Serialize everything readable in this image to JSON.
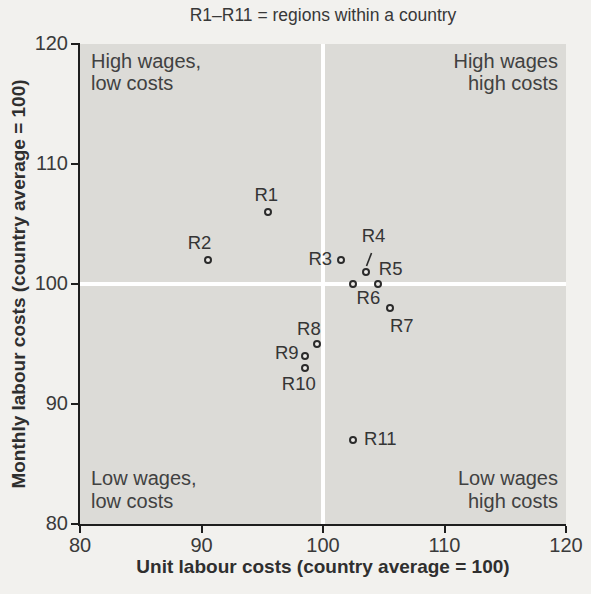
{
  "colors": {
    "page_bg": "#f2f1ee",
    "plot_bg": "#dcdbd7",
    "gridline": "#ffffff",
    "axis": "#1e1e1e",
    "text": "#3a3a3a",
    "marker_ring": "#2b2b2b",
    "marker_fill": "#eceae7"
  },
  "chart_data": {
    "type": "scatter",
    "title": "R1–R11 = regions within a country",
    "xlabel": "Unit labour costs (country average = 100)",
    "ylabel": "Monthly labour costs (country average = 100)",
    "xlim": [
      80,
      120
    ],
    "ylim": [
      80,
      120
    ],
    "xticks": [
      80,
      90,
      100,
      110,
      120
    ],
    "yticks": [
      80,
      90,
      100,
      110,
      120
    ],
    "grid": {
      "x": [
        100
      ],
      "y": [
        100
      ],
      "color": "#ffffff"
    },
    "legend": "none",
    "quadrant_labels": [
      {
        "text": "High wages,\nlow costs",
        "position": "top-left"
      },
      {
        "text": "High wages\nhigh costs",
        "position": "top-right"
      },
      {
        "text": "Low wages,\nlow costs",
        "position": "bottom-left"
      },
      {
        "text": "Low wages\nhigh costs",
        "position": "bottom-right"
      }
    ],
    "points": [
      {
        "label": "R1",
        "x": 95.5,
        "y": 106,
        "label_dx": -2,
        "label_dy": -17
      },
      {
        "label": "R2",
        "x": 90.5,
        "y": 102,
        "label_dx": -8,
        "label_dy": -17
      },
      {
        "label": "R3",
        "x": 101.5,
        "y": 102,
        "label_dx": -21,
        "label_dy": -1
      },
      {
        "label": "R4",
        "x": 103.5,
        "y": 101,
        "label_dx": 8,
        "label_dy": -36,
        "leader": {
          "from": [
            6,
            -19
          ],
          "to": [
            1,
            -6
          ]
        }
      },
      {
        "label": "R5",
        "x": 104.5,
        "y": 100,
        "label_dx": 13,
        "label_dy": -15
      },
      {
        "label": "R6",
        "x": 102.5,
        "y": 100,
        "label_dx": 15,
        "label_dy": 14
      },
      {
        "label": "R7",
        "x": 105.5,
        "y": 98,
        "label_dx": 12,
        "label_dy": 18
      },
      {
        "label": "R8",
        "x": 99.5,
        "y": 95,
        "label_dx": -8,
        "label_dy": -15
      },
      {
        "label": "R9",
        "x": 98.5,
        "y": 94,
        "label_dx": -18,
        "label_dy": -3
      },
      {
        "label": "R10",
        "x": 98.5,
        "y": 93,
        "label_dx": -6,
        "label_dy": 16
      },
      {
        "label": "R11",
        "x": 102.5,
        "y": 87,
        "label_dx": 27,
        "label_dy": -1
      }
    ]
  }
}
